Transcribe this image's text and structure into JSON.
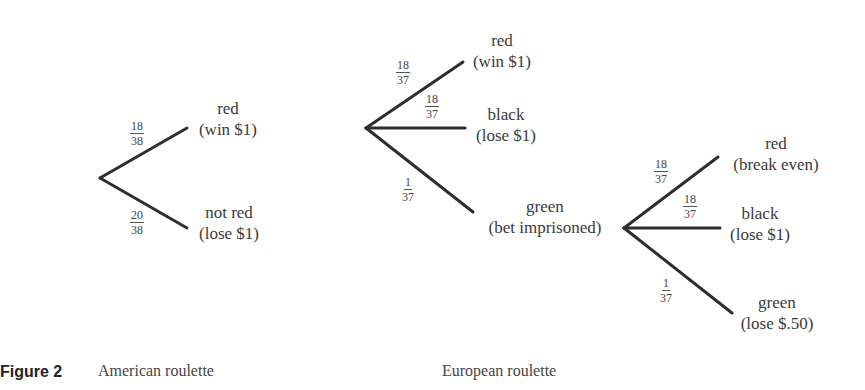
{
  "figure": {
    "label": "Figure 2",
    "captions": {
      "american": "American roulette",
      "european": "European roulette"
    }
  },
  "american_tree": {
    "branches": [
      {
        "prob_num": "18",
        "prob_den": "38",
        "outcome": "red",
        "result": "(win $1)"
      },
      {
        "prob_num": "20",
        "prob_den": "38",
        "outcome": "not red",
        "result": "(lose $1)"
      }
    ]
  },
  "european_tree": {
    "branches": [
      {
        "prob_num": "18",
        "prob_den": "37",
        "outcome": "red",
        "result": "(win $1)"
      },
      {
        "prob_num": "18",
        "prob_den": "37",
        "outcome": "black",
        "result": "(lose $1)"
      },
      {
        "prob_num": "1",
        "prob_den": "37",
        "outcome": "green",
        "result": "(bet imprisoned)"
      }
    ],
    "imprisoned_subtree": {
      "branches": [
        {
          "prob_num": "18",
          "prob_den": "37",
          "outcome": "red",
          "result": "(break even)"
        },
        {
          "prob_num": "18",
          "prob_den": "37",
          "outcome": "black",
          "result": "(lose $1)"
        },
        {
          "prob_num": "1",
          "prob_den": "37",
          "outcome": "green",
          "result": "(lose $.50)"
        }
      ]
    }
  },
  "colors": {
    "line": "#2e2e2e",
    "text": "#3a3a3a"
  }
}
